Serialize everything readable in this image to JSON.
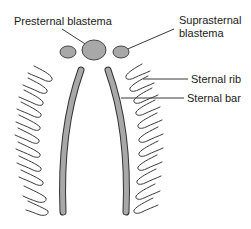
{
  "diagram": {
    "labels": {
      "presternal": "Presternal blastema",
      "suprasternal_line1": "Suprasternal",
      "suprasternal_line2": "blastema",
      "sternal_rib": "Sternal rib",
      "sternal_bar": "Sternal bar"
    },
    "colors": {
      "structure_fill": "#a8a8a8",
      "outline": "#3a3a3a",
      "text": "#1a1a1a",
      "background": "#ffffff"
    },
    "rib_count_per_side": 10
  }
}
